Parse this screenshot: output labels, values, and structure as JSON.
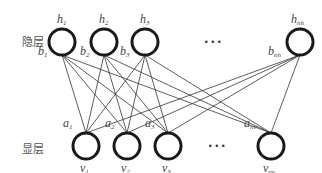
{
  "diagram": {
    "type": "restricted-boltzmann-machine",
    "hidden_layer": {
      "label": "隐层",
      "nodes": [
        {
          "id": "h1",
          "name": "h",
          "sub": "1",
          "bias": "b",
          "bias_sub": "1"
        },
        {
          "id": "h2",
          "name": "h",
          "sub": "2",
          "bias": "b",
          "bias_sub": "2"
        },
        {
          "id": "h3",
          "name": "h",
          "sub": "3",
          "bias": "b",
          "bias_sub": "3"
        },
        {
          "id": "hnh",
          "name": "h",
          "sub": "nh",
          "bias": "b",
          "bias_sub": "nh"
        }
      ],
      "ellipsis": "···"
    },
    "visible_layer": {
      "label": "显层",
      "nodes": [
        {
          "id": "v1",
          "name": "v",
          "sub": "1",
          "bias": "a",
          "bias_sub": "1"
        },
        {
          "id": "v2",
          "name": "v",
          "sub": "2",
          "bias": "a",
          "bias_sub": "2"
        },
        {
          "id": "v3",
          "name": "v",
          "sub": "3",
          "bias": "a",
          "bias_sub": "3"
        },
        {
          "id": "vnv",
          "name": "v",
          "sub": "nv",
          "bias": "a",
          "bias_sub": "nv"
        }
      ],
      "ellipsis": "···"
    },
    "connections": "fully-connected between hidden and visible layers",
    "colors": {
      "node_stroke": "#1a1a1a",
      "edge": "#333333",
      "text": "#444444"
    }
  }
}
